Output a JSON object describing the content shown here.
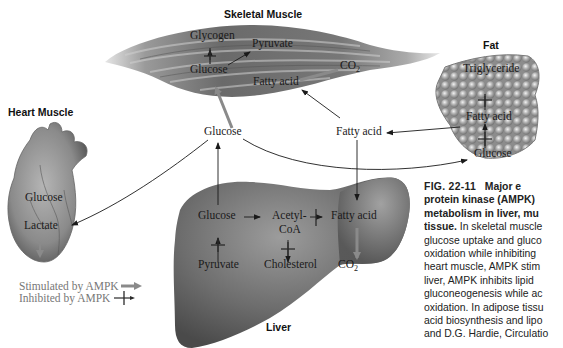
{
  "organs": {
    "skeletal_muscle": {
      "title": "Skeletal Muscle",
      "labels": {
        "glycogen": "Glycogen",
        "pyruvate": "Pyruvate",
        "glucose": "Glucose",
        "co2_main": "CO",
        "co2_sub": "2",
        "fatty_acid": "Fatty acid"
      }
    },
    "fat": {
      "title": "Fat",
      "labels": {
        "triglyceride": "Triglyceride",
        "fatty_acid": "Fatty acid",
        "glucose": "Glucose"
      }
    },
    "heart_muscle": {
      "title": "Heart Muscle",
      "labels": {
        "glucose": "Glucose",
        "lactate": "Lactate"
      }
    },
    "liver": {
      "title": "Liver",
      "labels": {
        "glucose": "Glucose",
        "acetyl_coa_line1": "Acetyl-",
        "acetyl_coa_line2": "CoA",
        "fatty_acid": "Fatty acid",
        "pyruvate": "Pyruvate",
        "cholesterol": "Cholesterol",
        "co2_main": "CO",
        "co2_sub": "2"
      }
    }
  },
  "blood": {
    "glucose": "Glucose",
    "fatty_acid": "Fatty acid"
  },
  "legend": {
    "stimulated": "Stimulated by AMPK",
    "inhibited": "Inhibited by AMPK"
  },
  "caption": {
    "figure_number": "FIG. 22-11",
    "lines": [
      {
        "bold": "",
        "text": "Major e"
      },
      {
        "bold": "protein kinase (AMPK)",
        "text": ""
      },
      {
        "bold": "metabolism in liver, mu",
        "text": ""
      },
      {
        "bold": "tissue.",
        "text": " In skeletal muscle"
      },
      {
        "bold": "",
        "text": "glucose uptake and gluco"
      },
      {
        "bold": "",
        "text": "oxidation while inhibiting"
      },
      {
        "bold": "",
        "text": "heart muscle, AMPK stim"
      },
      {
        "bold": "",
        "text": "liver, AMPK inhibits lipid"
      },
      {
        "bold": "",
        "text": "gluconeogenesis while ac"
      },
      {
        "bold": "",
        "text": "oxidation. In adipose tissu"
      },
      {
        "bold": "",
        "text": "acid biosynthesis and lipo"
      },
      {
        "bold": "",
        "text": "and D.G. Hardie, Circulatio"
      }
    ]
  },
  "colors": {
    "stimulated_arrow": "#8a8a8a",
    "inhibited_mark": "#3a3a3a",
    "pathway_arrow": "#1a1a1a",
    "organ_dark": "#4a4a4a",
    "organ_light": "#c8c8c8"
  }
}
